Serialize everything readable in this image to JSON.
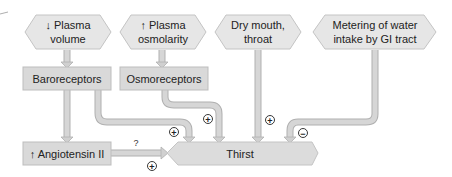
{
  "diagram": {
    "stimuli": [
      {
        "id": "plasma-volume",
        "line1": "↓ Plasma",
        "line2": "volume"
      },
      {
        "id": "plasma-osmolarity",
        "line1": "↑ Plasma",
        "line2": "osmolarity"
      },
      {
        "id": "dry-mouth",
        "line1": "Dry mouth,",
        "line2": "throat"
      },
      {
        "id": "metering",
        "line1": "Metering of water",
        "line2": "intake by GI tract"
      }
    ],
    "receptors": [
      {
        "id": "baroreceptors",
        "label": "Baroreceptors"
      },
      {
        "id": "osmoreceptors",
        "label": "Osmoreceptors"
      }
    ],
    "angiotensin": {
      "label": "↑ Angiotensin II"
    },
    "thirst": {
      "label": "Thirst"
    },
    "signs": {
      "baro_to_thirst": "+",
      "osmo_to_thirst": "+",
      "dry_to_thirst": "+",
      "metering_to_thirst": "−",
      "angio_to_thirst": "+",
      "angio_question": "?"
    },
    "colors": {
      "box_fill": "#d9d9d9",
      "box_stroke": "#bdbdbd",
      "hex_fill": "#e6e6e6",
      "arrow_fill": "#d4d4d4",
      "arrow_stroke": "#b0b0b0",
      "text": "#222222"
    }
  }
}
